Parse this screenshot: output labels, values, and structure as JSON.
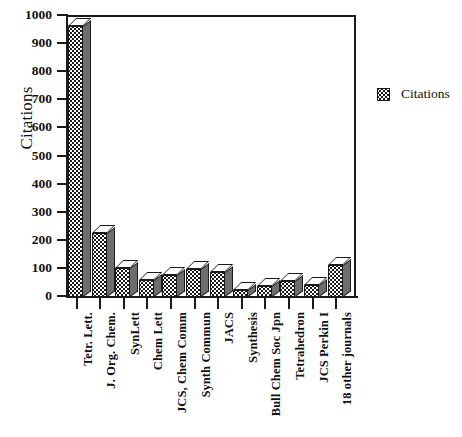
{
  "chart_data": {
    "type": "bar",
    "title": "",
    "subtitle": "",
    "xlabel": "",
    "ylabel": "Citations",
    "ylim": [
      0,
      1000
    ],
    "ytick_step": 100,
    "ytick_labels": [
      "1000",
      "900",
      "800",
      "700",
      "600",
      "500",
      "400",
      "300",
      "200",
      "100",
      "0"
    ],
    "grid": false,
    "legend_position": "right",
    "style": "3d-bar",
    "categories": [
      "Tetr. Lett.",
      "J. Org. Chem.",
      "SynLett",
      "Chem Lett",
      "JCS, Chem Comm",
      "Synth Commun",
      "JACS",
      "Synthesis",
      "Bull Chem Soc Jpn",
      "Tetrahedron",
      "JCS Perkin I",
      "18 other journals"
    ],
    "series": [
      {
        "name": "Citations",
        "values": [
          965,
          228,
          102,
          62,
          80,
          98,
          88,
          25,
          38,
          58,
          42,
          115
        ]
      }
    ]
  },
  "legend": {
    "entries": [
      {
        "label": "Citations",
        "swatch": "stipple-pattern-swatch"
      }
    ]
  },
  "colors": {
    "axis": "#1a1a1a",
    "bar_front": "#ffffff",
    "bar_pattern": "#1a1a1a",
    "bar_side": "#6e6e6e",
    "bar_top": "#ffffff",
    "background": "#ffffff"
  }
}
